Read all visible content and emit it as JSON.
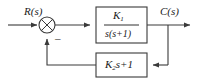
{
  "diagram": {
    "type": "control-system-block-diagram",
    "signals": {
      "input_label": "R(s)",
      "output_label": "C(s)"
    },
    "summing_junction": {
      "name": "summing-junction",
      "style": "circle-with-cross",
      "cx": 47,
      "cy": 25,
      "r": 8,
      "input_sign": "+",
      "feedback_sign": "−",
      "feedback_sign_display": "–"
    },
    "blocks": [
      {
        "name": "forward-block",
        "kind": "transfer-function-fraction",
        "numerator": "K",
        "numerator_sub": "1",
        "denominator": "s(s+1)",
        "x": 96,
        "y": 7,
        "w": 51,
        "h": 36
      },
      {
        "name": "feedback-block",
        "kind": "transfer-function-expression",
        "expr_lead": "K",
        "expr_sub": "2",
        "expr_tail": "s+1",
        "x": 96,
        "y": 53,
        "w": 51,
        "h": 24
      }
    ],
    "branch_point": {
      "name": "output-branch-point",
      "x": 168,
      "y": 25
    },
    "colors": {
      "line": "#3a3a3a",
      "block_border": "#3a3a3a",
      "text": "#1a1a1a",
      "background": "#ffffff"
    }
  }
}
